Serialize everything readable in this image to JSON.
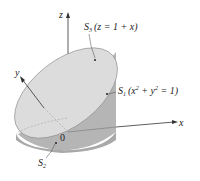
{
  "figure": {
    "axes": {
      "x": "x",
      "y": "y",
      "z": "z",
      "origin": "0"
    },
    "surfaces": [
      {
        "id": "S3",
        "name": "S",
        "sub": "3",
        "equation": "(z = 1 + x)"
      },
      {
        "id": "S1",
        "name": "S",
        "sub": "1",
        "equation_pre": "(x",
        "sup1": "2",
        "mid": " + y",
        "sup2": "2",
        "equation_post": " = 1)"
      },
      {
        "id": "S2",
        "name": "S",
        "sub": "2"
      }
    ],
    "colors": {
      "top_surface": "#d9d9d9",
      "side_surface": "#b3b3b3",
      "side_dark": "#a6a6a6",
      "axis": "#333333",
      "background": "#ffffff"
    }
  }
}
